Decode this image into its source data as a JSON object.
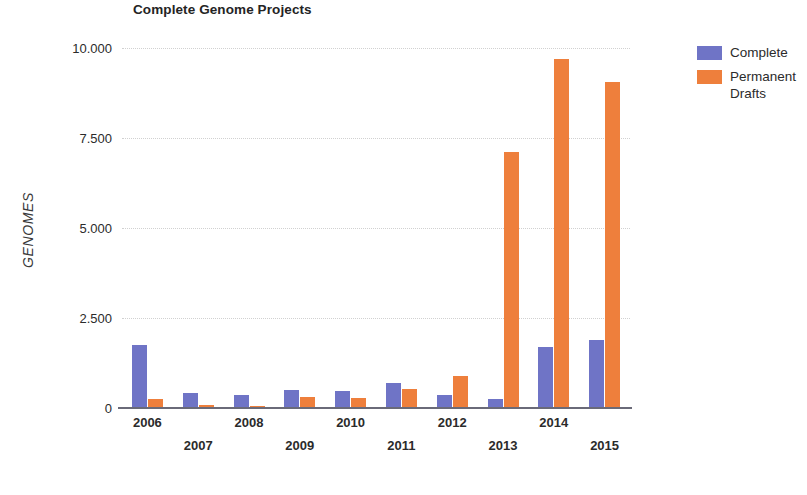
{
  "chart_data": {
    "type": "bar",
    "title": "Complete Genome Projects",
    "xlabel": "YEAR",
    "ylabel": "GENOMES",
    "categories": [
      "2006",
      "2007",
      "2008",
      "2009",
      "2010",
      "2011",
      "2012",
      "2013",
      "2014",
      "2015"
    ],
    "series": [
      {
        "name": "Complete",
        "color": "#6f74c6",
        "values": [
          1750,
          420,
          360,
          490,
          480,
          700,
          370,
          250,
          1700,
          1900
        ]
      },
      {
        "name": "Permanent Drafts",
        "color": "#ee7f3c",
        "values": [
          260,
          90,
          60,
          310,
          270,
          530,
          900,
          7100,
          9700,
          9050
        ]
      }
    ],
    "ylim": [
      0,
      10000
    ],
    "yticks": [
      0,
      2500,
      5000,
      7500,
      10000
    ],
    "ytick_labels": [
      "0",
      "2.500",
      "5.000",
      "7.500",
      "10.000"
    ],
    "grid": true,
    "legend_position": "right"
  },
  "legend": {
    "entries": [
      {
        "label": "Complete",
        "color": "#6f74c6"
      },
      {
        "label": "Permanent Drafts",
        "color": "#ee7f3c"
      }
    ]
  }
}
